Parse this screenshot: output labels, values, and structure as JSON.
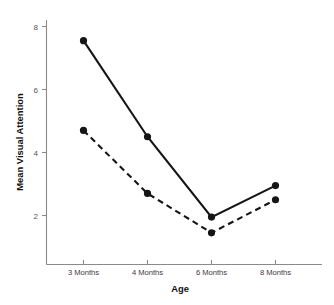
{
  "chart_data": {
    "type": "line",
    "title": "",
    "xlabel": "Age",
    "ylabel": "Mean Visual Attention",
    "categories": [
      "3 Months",
      "4 Months",
      "6 Months",
      "8 Months"
    ],
    "series": [
      {
        "name": "solid-line-series",
        "style": "solid",
        "marker": "filled-circle",
        "color": "#151515",
        "values": [
          7.55,
          4.5,
          1.95,
          2.95
        ]
      },
      {
        "name": "dashed-line-series",
        "style": "dashed",
        "marker": "filled-circle",
        "color": "#151515",
        "values": [
          4.7,
          2.7,
          1.45,
          2.5
        ]
      }
    ],
    "ylim": [
      0.85,
      8.6
    ],
    "yticks": [
      2,
      4,
      6,
      8
    ],
    "ytick_labels": [
      "2",
      "4",
      "6",
      "8"
    ],
    "xtick_labels": [
      "3 Months",
      "4 Months",
      "6 Months",
      "8 Months"
    ],
    "grid": false,
    "legend": "none",
    "axis_color": "#8a8a8a",
    "text_color": "#111111"
  },
  "axes": {
    "x_title": "Age",
    "y_title": "Mean Visual Attention"
  },
  "yticks": {
    "t0": "2",
    "t1": "4",
    "t2": "6",
    "t3": "8"
  },
  "xticks": {
    "t0": "3 Months",
    "t1": "4 Months",
    "t2": "6 Months",
    "t3": "8 Months"
  }
}
